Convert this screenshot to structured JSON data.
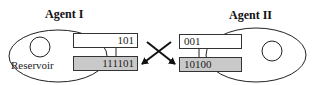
{
  "agents": [
    {
      "title": "Agent I",
      "reservoir_label": "Reservoir",
      "top_register": "101",
      "bottom_register": "111101"
    },
    {
      "title": "Agent II",
      "top_register": "001",
      "bottom_register": "10100"
    }
  ],
  "colors": {
    "stroke": "#222222",
    "register_fill_top": "#ffffff",
    "register_fill_bottom": "#c9c9c9"
  },
  "arrows": "crossed exchange arrows between agents' top and bottom registers"
}
